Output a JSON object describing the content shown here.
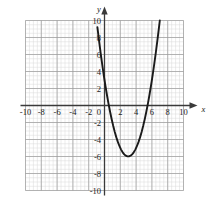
{
  "chart_data": {
    "type": "line",
    "title": "",
    "subtitle": "",
    "xlabel": "x",
    "ylabel": "y",
    "xlim": [
      -10,
      10
    ],
    "ylim": [
      -10,
      10
    ],
    "grid": true,
    "grid_major_step": 2,
    "grid_minor_step": 0.5,
    "legend": "none",
    "x_tick_labels": [
      "-10",
      "-8",
      "-6",
      "-4",
      "-2",
      "0",
      "2",
      "4",
      "6",
      "8",
      "10"
    ],
    "x_ticks": [
      -10,
      -8,
      -6,
      -4,
      -2,
      0,
      2,
      4,
      6,
      8,
      10
    ],
    "y_tick_labels": [
      "-10",
      "-8",
      "-6",
      "-4",
      "-2",
      "2",
      "4",
      "6",
      "8",
      "10"
    ],
    "y_ticks": [
      -10,
      -8,
      -6,
      -4,
      -2,
      2,
      4,
      6,
      8,
      10
    ],
    "origin_label": "0",
    "series": [
      {
        "name": "parabola",
        "equation": "y = (x - 3)^2 - 6",
        "color": "#1a1a1a",
        "vertex": [
          3,
          -6
        ],
        "y_intercept": 3,
        "roots": [
          0.551,
          5.449
        ],
        "x": [
          -0.9,
          -0.7,
          -0.5,
          -0.3,
          -0.1,
          0.1,
          0.3,
          0.5,
          0.7,
          0.9,
          1.1,
          1.3,
          1.5,
          1.7,
          1.9,
          2.1,
          2.3,
          2.5,
          2.7,
          2.9,
          3.1,
          3.3,
          3.5,
          3.7,
          3.9,
          4.1,
          4.3,
          4.5,
          4.7,
          4.9,
          5.1,
          5.3,
          5.5,
          5.7,
          5.9,
          6.1,
          6.3,
          6.5,
          6.7,
          6.9,
          7.0
        ],
        "values": [
          9.21,
          7.69,
          6.25,
          4.89,
          3.61,
          2.41,
          1.29,
          0.25,
          -0.71,
          -1.59,
          -2.39,
          -3.11,
          -3.75,
          -4.31,
          -4.79,
          -5.19,
          -5.51,
          -5.75,
          -5.91,
          -5.99,
          -5.99,
          -5.91,
          -5.75,
          -5.51,
          -5.19,
          -4.79,
          -4.31,
          -3.75,
          -3.11,
          -2.39,
          -1.59,
          -0.71,
          0.25,
          1.29,
          2.41,
          3.61,
          4.89,
          6.25,
          7.69,
          9.21,
          10.0
        ]
      }
    ],
    "colors": {
      "curve": "#1a1a1a",
      "axis": "#3a3a3a",
      "grid_major": "#9a9a9a",
      "grid_minor": "#d8d8d8",
      "label": "#1a1a1a",
      "background": "#ffffff"
    }
  }
}
